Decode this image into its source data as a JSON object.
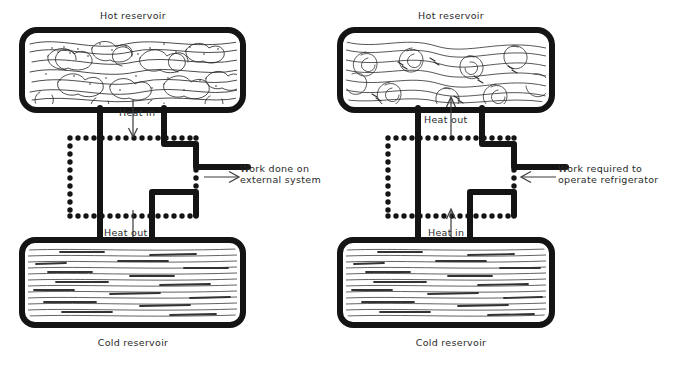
{
  "figure": {
    "type": "diagram",
    "style": "hand-drawn line art, black ink on white"
  },
  "panels": [
    {
      "id": "heat-engine",
      "role": "Heat engine (left panel)",
      "hot_reservoir_label": "Hot reservoir",
      "cold_reservoir_label": "Cold reservoir",
      "top_flow_label": "Heat in",
      "bottom_flow_label": "Heat out",
      "work_label_line1": "Work done on",
      "work_label_line2": "external system",
      "top_arrow_direction": "down",
      "bottom_arrow_direction": "down",
      "work_arrow_direction": "right",
      "hot_texture": "turbulent swirls and bubbles",
      "cold_texture": "horizontal calm striations"
    },
    {
      "id": "refrigerator",
      "role": "Refrigerator (right panel)",
      "hot_reservoir_label": "Hot reservoir",
      "cold_reservoir_label": "Cold reservoir",
      "top_flow_label": "Heat out",
      "bottom_flow_label": "Heat in",
      "work_label_line1": "Work required to",
      "work_label_line2": "operate refrigerator",
      "top_arrow_direction": "up",
      "bottom_arrow_direction": "up",
      "work_arrow_direction": "left",
      "hot_texture": "turbulent swirls and vortices",
      "cold_texture": "horizontal calm striations"
    }
  ],
  "colors": {
    "ink": "#1b1b1b",
    "background": "#ffffff",
    "texture": "#2c2c2c"
  }
}
